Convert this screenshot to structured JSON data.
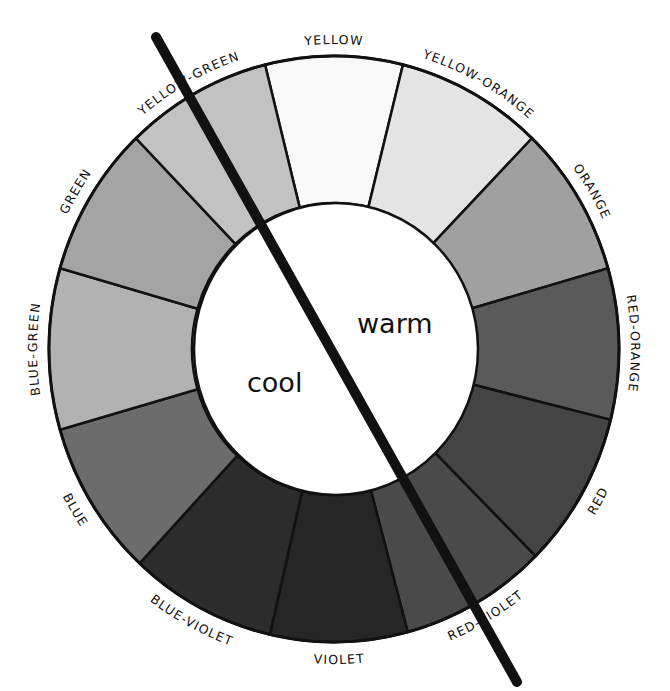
{
  "diagram": {
    "center": {
      "cx": 334,
      "cy": 349
    },
    "outer": {
      "rx": 285,
      "ry": 293
    },
    "inner": {
      "rx": 142,
      "ry": 146
    },
    "divider": {
      "x1": 156,
      "y1": 37,
      "x2": 517,
      "y2": 682,
      "width": 10,
      "color": "#111111"
    },
    "warm_label": "warm",
    "cool_label": "cool",
    "segments": [
      {
        "name": "YELLOW",
        "start": -14,
        "end": 14,
        "fill": "#f8f8f8"
      },
      {
        "name": "YELLOW-ORANGE",
        "start": 14,
        "end": 44,
        "fill": "#e4e4e4"
      },
      {
        "name": "ORANGE",
        "start": 44,
        "end": 74,
        "fill": "#a0a0a0"
      },
      {
        "name": "RED-ORANGE",
        "start": 74,
        "end": 104,
        "fill": "#5a5a5a"
      },
      {
        "name": "RED",
        "start": 104,
        "end": 135,
        "fill": "#444444"
      },
      {
        "name": "RED-VIOLET",
        "start": 135,
        "end": 165,
        "fill": "#4a4a4a"
      },
      {
        "name": "VIOLET",
        "start": 165,
        "end": 193,
        "fill": "#262626"
      },
      {
        "name": "BLUE-VIOLET",
        "start": 193,
        "end": 223,
        "fill": "#2c2c2c"
      },
      {
        "name": "BLUE",
        "start": 223,
        "end": 254,
        "fill": "#6c6c6c"
      },
      {
        "name": "BLUE-GREEN",
        "start": 254,
        "end": 286,
        "fill": "#b2b2b2"
      },
      {
        "name": "GREEN",
        "start": 286,
        "end": 316,
        "fill": "#a4a4a4"
      },
      {
        "name": "YELLOW-GREEN",
        "start": 316,
        "end": 346,
        "fill": "#c2c2c2"
      }
    ],
    "extra_boundaries": [
      {
        "angle": 150,
        "note": "sub-division inside red-violet"
      }
    ]
  }
}
